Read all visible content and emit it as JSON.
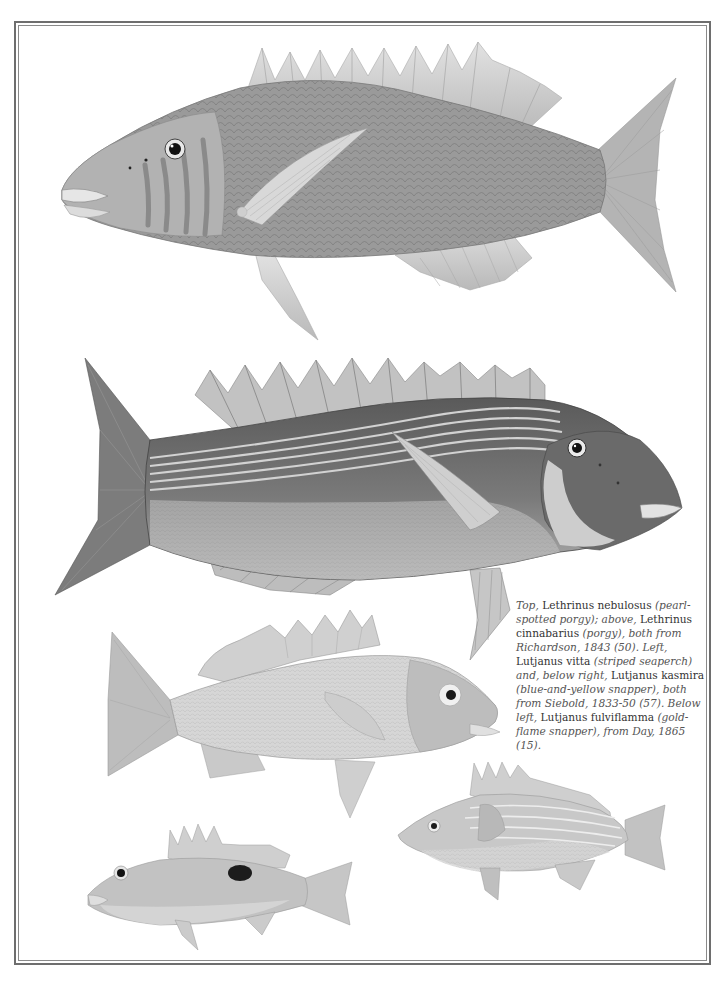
{
  "page": {
    "frame": {
      "style": "double-rule border",
      "outer_color": "#6e6e6e",
      "inner_color": "#8a8a8a"
    },
    "illustrations": [
      {
        "id": "top",
        "species": "Lethrinus nebulosus",
        "common_name": "pearl-spotted porgy",
        "position": "top",
        "facing": "left"
      },
      {
        "id": "above",
        "species": "Lethrinus cinnabarius",
        "common_name": "porgy",
        "position": "second",
        "facing": "right"
      },
      {
        "id": "left",
        "species": "Lutjanus vitta",
        "common_name": "striped seaperch",
        "position": "middle-left",
        "facing": "right"
      },
      {
        "id": "below-right",
        "species": "Lutjanus kasmira",
        "common_name": "blue-and-yellow snapper",
        "position": "bottom-right",
        "facing": "left"
      },
      {
        "id": "below-left",
        "species": "Lutjanus fulviflamma",
        "common_name": "gold-flame snapper",
        "position": "bottom-left",
        "facing": "left"
      }
    ],
    "caption": {
      "segments": [
        {
          "style": "it",
          "text": "Top,"
        },
        {
          "style": "rm",
          "text": " Lethrinus nebulosus "
        },
        {
          "style": "it",
          "text": "(pearl-spotted porgy); above,"
        },
        {
          "style": "rm",
          "text": " Lethrinus cinnabarius "
        },
        {
          "style": "it",
          "text": "(porgy), both from Richardson, 1843 (50). Left,"
        },
        {
          "style": "rm",
          "text": " Lutjanus vitta "
        },
        {
          "style": "it",
          "text": "(striped seaperch) and, below right,"
        },
        {
          "style": "rm",
          "text": " Lutjanus kasmira "
        },
        {
          "style": "it",
          "text": "(blue-and-yellow snapper), both from Siebold, 1833-50 (57). Below left,"
        },
        {
          "style": "rm",
          "text": " Lutjanus fulviflamma "
        },
        {
          "style": "it",
          "text": "(gold-flame snapper), from Day, 1865 (15)."
        }
      ]
    }
  }
}
